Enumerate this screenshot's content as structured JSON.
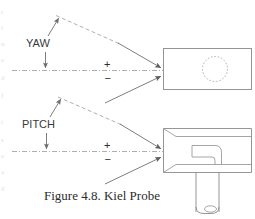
{
  "figure": {
    "caption": "Figure 4.8.  Kiel Probe",
    "domain": "technical-line-diagram",
    "background_color": "#ffffff",
    "ink_color": "#7d7d7d"
  },
  "labels": {
    "yaw": "YAW",
    "pitch": "PITCH",
    "plus_sign": "+",
    "minus_sign": "−"
  },
  "angle_panels": [
    {
      "name": "yaw",
      "label": "YAW",
      "positive_sign": "+",
      "negative_sign": "−",
      "axis_style": "dash-dot centerline",
      "reference_line_style": "dashed",
      "view": "front"
    },
    {
      "name": "pitch",
      "label": "PITCH",
      "positive_sign": "+",
      "negative_sign": "−",
      "axis_style": "dash-dot centerline",
      "reference_line_style": "dashed",
      "view": "side-section"
    }
  ],
  "probe_views": {
    "front": {
      "name": "probe-front-view",
      "shape": "rectangle",
      "inner_feature": "dotted-circle",
      "inner_feature_style": "hidden-dotted"
    },
    "side": {
      "name": "probe-side-view",
      "shape": "shroud-with-stem",
      "features": [
        "chamfered-inlet",
        "internal-l-tube",
        "vertical-stem",
        "stem-tip-ellipse"
      ]
    }
  },
  "edge_fragments": {
    "note": "faint partial characters bleeding in from adjacent text column at left margin",
    "glyphs": [
      "r",
      "i",
      "n",
      "e",
      "d",
      "f",
      "t",
      "s",
      "e",
      "a",
      "g"
    ]
  }
}
